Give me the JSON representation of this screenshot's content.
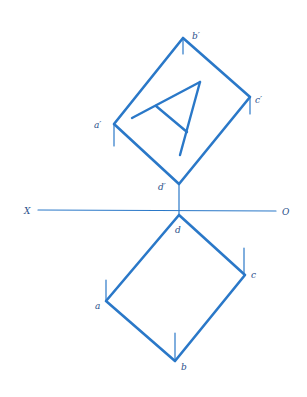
{
  "diagram": {
    "type": "orthographic-projection",
    "colors": {
      "stroke": "#2a78c8",
      "label": "#2a4f8a",
      "background": "#ffffff"
    },
    "reference_line": {
      "left_label": "X",
      "right_label": "O"
    },
    "elevation": {
      "labels": {
        "a": "a′",
        "b": "b′",
        "c": "c′",
        "d": "d′"
      },
      "inscribed_letter": "A"
    },
    "plan": {
      "labels": {
        "a": "a",
        "b": "b",
        "c": "c",
        "d": "d"
      }
    }
  }
}
